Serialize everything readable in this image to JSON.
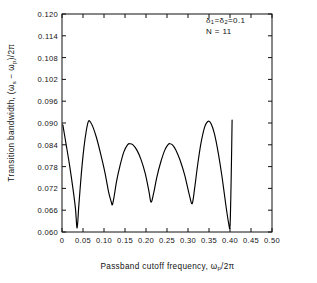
{
  "chart_data": {
    "type": "line",
    "title": "",
    "subtitle": "",
    "xlabel": "Passband cutoff frequency, ωp/2π",
    "ylabel": "Transition bandwidth, (ωs − ωp)/2π",
    "xlim": [
      0.0,
      0.5
    ],
    "ylim": [
      0.06,
      0.12
    ],
    "grid": false,
    "legend_position": "none",
    "xticks": [
      0,
      0.05,
      0.1,
      0.15,
      0.2,
      0.25,
      0.3,
      0.35,
      0.4,
      0.45,
      0.5
    ],
    "xtick_labels": [
      "0",
      "0.05",
      "0.10",
      "0.15",
      "0.20",
      "0.25",
      "0.30",
      "0.35",
      "0.40",
      "0.45",
      "0.50"
    ],
    "yticks": [
      0.06,
      0.066,
      0.072,
      0.078,
      0.084,
      0.09,
      0.096,
      0.102,
      0.108,
      0.114,
      0.12
    ],
    "ytick_labels": [
      "0.060",
      "0.066",
      "0.072",
      "0.078",
      "0.084",
      "0.090",
      "0.096",
      "0.102",
      "0.108",
      "0.114",
      "0.120"
    ],
    "line_color": "#000000",
    "series": [
      {
        "name": "transition bandwidth",
        "x": [
          0.002,
          0.01,
          0.018,
          0.026,
          0.032,
          0.036,
          0.04,
          0.046,
          0.052,
          0.058,
          0.063,
          0.068,
          0.074,
          0.082,
          0.092,
          0.102,
          0.111,
          0.117,
          0.12,
          0.124,
          0.13,
          0.138,
          0.147,
          0.156,
          0.162,
          0.169,
          0.178,
          0.188,
          0.198,
          0.207,
          0.212,
          0.218,
          0.226,
          0.235,
          0.245,
          0.253,
          0.257,
          0.263,
          0.271,
          0.281,
          0.292,
          0.303,
          0.31,
          0.316,
          0.323,
          0.331,
          0.34,
          0.348,
          0.355,
          0.363,
          0.372,
          0.381,
          0.39,
          0.397,
          0.4,
          0.402,
          0.404,
          0.405
        ],
        "y": [
          0.0895,
          0.084,
          0.0784,
          0.072,
          0.0665,
          0.0611,
          0.0672,
          0.076,
          0.083,
          0.088,
          0.0905,
          0.0902,
          0.0888,
          0.086,
          0.0815,
          0.0765,
          0.071,
          0.0684,
          0.0675,
          0.0697,
          0.074,
          0.0782,
          0.082,
          0.084,
          0.0843,
          0.084,
          0.0826,
          0.08,
          0.0762,
          0.0712,
          0.0682,
          0.0706,
          0.0752,
          0.0792,
          0.0826,
          0.0841,
          0.0843,
          0.084,
          0.0826,
          0.0798,
          0.0757,
          0.0703,
          0.0678,
          0.0722,
          0.0785,
          0.0845,
          0.089,
          0.0905,
          0.0898,
          0.087,
          0.0818,
          0.0752,
          0.0675,
          0.0622,
          0.0615,
          0.07,
          0.083,
          0.0908
        ]
      }
    ],
    "annotations": [
      {
        "id": "ann1",
        "text_parts": {
          "delta": "δ",
          "sub1": "1",
          "eq1": "=",
          "sub2": "2",
          "eq2": "=",
          "value": "0.1"
        }
      },
      {
        "id": "ann2",
        "text": "N = 11"
      }
    ]
  },
  "labels": {
    "y_axis_prefix": "Transition bandwidth, (",
    "y_axis_omega_s": "ω",
    "y_axis_sub_s": "s",
    "y_axis_minus": " − ",
    "y_axis_omega_p": "ω",
    "y_axis_sub_p": "p",
    "y_axis_suffix": ")/2π",
    "x_axis_prefix": "Passband  cutoff  frequency,  ",
    "x_axis_omega_p": "ω",
    "x_axis_sub_p": "p",
    "x_axis_suffix": "/2π",
    "ann_delta": "δ",
    "ann_sub_1": "1",
    "ann_eq": "=",
    "ann_sub_2": "2",
    "ann_value": "0.1",
    "ann_n": "N = 11"
  },
  "style": {
    "axis_color": "#111111",
    "background": "#ffffff",
    "line_color": "#000000"
  }
}
